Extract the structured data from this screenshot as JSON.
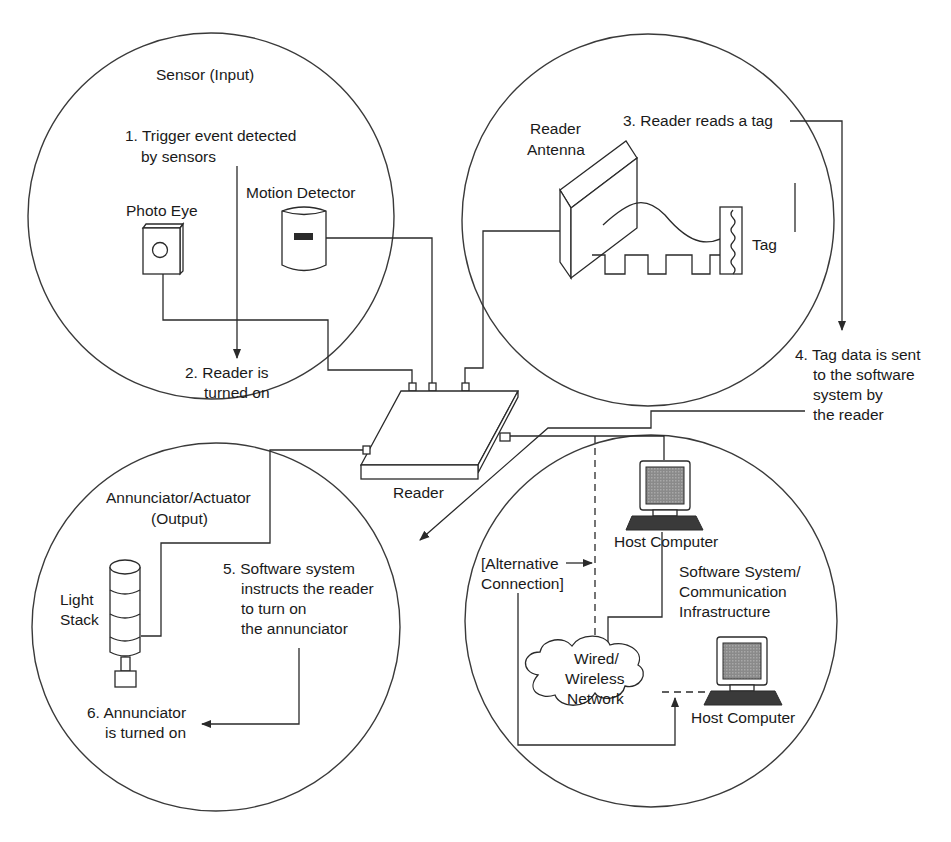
{
  "diagram": {
    "zones": {
      "sensor": {
        "heading": "Sensor (Input)",
        "devices": {
          "photo_eye": "Photo Eye",
          "motion_detector": "Motion Detector"
        },
        "steps": {
          "step1_line1": "1. Trigger event detected",
          "step1_line2": "by sensors",
          "step2_line1": "2. Reader is",
          "step2_line2": "turned on"
        }
      },
      "tag_read": {
        "devices": {
          "antenna_line1": "Reader",
          "antenna_line2": "Antenna",
          "tag": "Tag"
        },
        "steps": {
          "step3": "3. Reader reads a tag",
          "step4_line1": "4. Tag data is sent",
          "step4_line2": "to the software",
          "step4_line3": "system by",
          "step4_line4": "the reader"
        }
      },
      "output": {
        "heading_line1": "Annunciator/Actuator",
        "heading_line2": "(Output)",
        "devices": {
          "light_stack_line1": "Light",
          "light_stack_line2": "Stack"
        },
        "steps": {
          "step5_line1": "5. Software system",
          "step5_line2": "instructs the reader",
          "step5_line3": "to turn on",
          "step5_line4": "the annunciator",
          "step6_line1": "6. Annunciator",
          "step6_line2": "is turned on"
        }
      },
      "software": {
        "heading_line1": "Software System/",
        "heading_line2": "Communication",
        "heading_line3": "Infrastructure",
        "devices": {
          "host_computer_1": "Host Computer",
          "host_computer_2": "Host Computer",
          "network_line1": "Wired/",
          "network_line2": "Wireless",
          "network_line3": "Network",
          "alt_line1": "[Alternative",
          "alt_line2": "Connection]"
        }
      }
    },
    "center": {
      "reader_label": "Reader"
    },
    "colors": {
      "line": "#2a2a2a",
      "background": "#ffffff",
      "screen": "#9a9a9a",
      "keyboard": "#3a3a3a"
    }
  }
}
